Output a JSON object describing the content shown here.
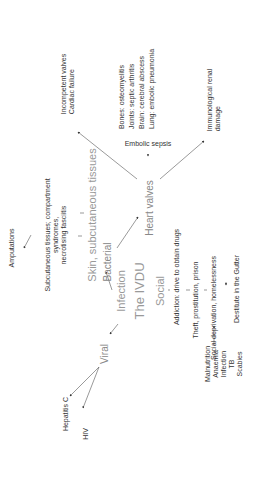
{
  "diagram": {
    "orientation": "rotated -90deg (text reads bottom-to-top)",
    "center": {
      "line1": "Infection",
      "line2": "The IVDU",
      "line3": "Social"
    },
    "infection_branches": {
      "bacterial": {
        "label": "Bacterial",
        "skin": {
          "label": "Skin, subcutaneous tissues",
          "complication": "Subcutaneous tissues; compartment syndromes, necrotising fasciitis",
          "complication_lines": [
            "Subcutaneous tissues; compartment",
            "syndromes,",
            "necrotising fasciitis"
          ],
          "outcome": "Amputations"
        },
        "heart": {
          "label": "Heart valves",
          "valves": [
            "Incompetent valves",
            "Cardiac failure"
          ],
          "embolic": {
            "label": "Embolic sepsis",
            "sites": [
              "Bones: osteomyelitis",
              "Joints: septic arthritis",
              "Brain: cerebral abscess",
              "Lung: embolic pneumonia"
            ]
          },
          "renal": [
            "Immunological renal",
            "damage"
          ]
        }
      },
      "viral": {
        "label": "Viral",
        "items": [
          "Hepatitis C",
          "HIV"
        ]
      }
    },
    "social_chain": {
      "addiction": "Addiction: drive to obtain drugs",
      "theft": "Theft, prostitution, prison",
      "deprivation": "Social deprivation, homelessness",
      "gutter": "Destitute in the Gutter",
      "outcomes": [
        "Malnutrition",
        "Anaemia",
        "Infection",
        "TB",
        "Scabies"
      ]
    }
  }
}
